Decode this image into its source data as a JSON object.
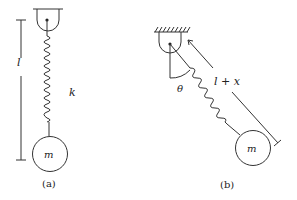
{
  "figure": {
    "panel_a": {
      "caption": "(a)",
      "length_label": "l",
      "spring_label": "k",
      "mass_label": "m"
    },
    "panel_b": {
      "caption": "(b)",
      "length_label": "l + x",
      "angle_label": "θ",
      "mass_label": "m"
    }
  },
  "colors": {
    "stroke": "#333333",
    "background": "#ffffff"
  }
}
